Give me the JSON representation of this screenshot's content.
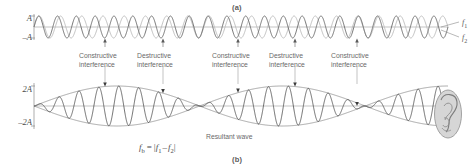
{
  "figure": {
    "panel_a_label": "(a)",
    "panel_b_label": "(b)",
    "resultant_caption": "Resultant wave"
  },
  "top_plot": {
    "y_axis_top_label": "A",
    "y_axis_bottom_label": "–A",
    "wave1_label": "f",
    "wave1_sub": "1",
    "wave2_label": "f",
    "wave2_sub": "2",
    "wave1_color": "#6e6e6e",
    "wave2_color": "#bdbdbd"
  },
  "bottom_plot": {
    "y_axis_top_label": "2A",
    "y_axis_bottom_label": "–2A",
    "wave_color": "#4a4a4a",
    "envelope_color": "#7a7a7a"
  },
  "annotations": [
    {
      "line1": "Constructive",
      "line2": "interference",
      "x": 105
    },
    {
      "line1": "Destructive",
      "line2": "interference",
      "x": 163
    },
    {
      "line1": "Constructive",
      "line2": "interference",
      "x": 238
    },
    {
      "line1": "Destructive",
      "line2": "interference",
      "x": 295
    },
    {
      "line1": "Constructive",
      "line2": "interference",
      "x": 357
    }
  ],
  "formula": {
    "lhs": "f",
    "lhs_sub": "b",
    "equals": "=",
    "open": "|",
    "term1": "f",
    "term1_sub": "1",
    "minus": "–",
    "term2": "f",
    "term2_sub": "2",
    "close": "|"
  },
  "chart_data": {
    "type": "line",
    "panels": [
      {
        "id": "a",
        "label": "(a)",
        "ylabel_top": "A",
        "ylabel_bottom": "-A",
        "ylim": [
          -1,
          1
        ],
        "xlim": [
          0,
          1
        ],
        "grid": false,
        "series": [
          {
            "name": "f1",
            "cycles": 22,
            "amplitude": 1,
            "color": "#6e6e6e"
          },
          {
            "name": "f2",
            "cycles": 19.5,
            "amplitude": 1,
            "color": "#bdbdbd"
          }
        ],
        "legend_position": "right",
        "legend_entries": [
          "f1",
          "f2"
        ]
      },
      {
        "id": "b",
        "label": "(b)",
        "ylabel_top": "2A",
        "ylabel_bottom": "-2A",
        "ylim": [
          -2,
          2
        ],
        "xlim": [
          0,
          1
        ],
        "grid": false,
        "series": [
          {
            "name": "Resultant wave",
            "cycles": 20.75,
            "beat_cycles": 2.5,
            "amplitude": 2,
            "color": "#4a4a4a"
          },
          {
            "name": "envelope",
            "beat_cycles": 2.5,
            "amplitude": 2,
            "color": "#7a7a7a"
          }
        ],
        "annotations": [
          {
            "text": "Constructive interference",
            "x_px": 105,
            "type": "antinode"
          },
          {
            "text": "Destructive interference",
            "x_px": 163,
            "type": "node"
          },
          {
            "text": "Constructive interference",
            "x_px": 238,
            "type": "antinode"
          },
          {
            "text": "Destructive interference",
            "x_px": 295,
            "type": "node"
          },
          {
            "text": "Constructive interference",
            "x_px": 357,
            "type": "antinode"
          }
        ],
        "equation": "f_b = |f_1 - f_2|"
      }
    ]
  }
}
